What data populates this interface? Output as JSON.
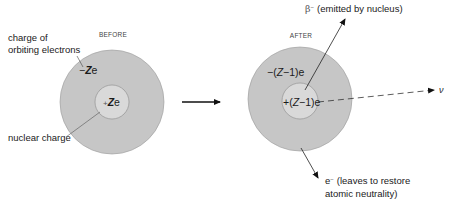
{
  "before": {
    "title": "BEFORE",
    "electron_charge_label_line1": "charge of",
    "electron_charge_label_line2": "orbiting electrons",
    "electron_charge_sign": "−",
    "electron_charge_Z": "Z",
    "electron_charge_e": "e",
    "nuclear_charge_sign": "+",
    "nuclear_charge_Z": "Z",
    "nuclear_charge_e": "e",
    "nuclear_charge_label": "nuclear charge"
  },
  "after": {
    "title": "AFTER",
    "beta_symbol": "β",
    "beta_sup": "−",
    "beta_label": "(emitted by nucleus)",
    "electron_shell_prefix": "−(",
    "electron_shell_Z": "Z",
    "electron_shell_suffix": "−1)e",
    "nucleus_prefix": "+(",
    "nucleus_Z": "Z",
    "nucleus_suffix": "−1)e",
    "neutrino_symbol": "ν",
    "electron_symbol": "e",
    "electron_sup": "−",
    "electron_label_line1": "(leaves to restore",
    "electron_label_line2": "atomic neutrality)"
  },
  "colors": {
    "outer_shell": "#c6c6c6",
    "outer_stroke": "#9a9a9a",
    "nucleus": "#d9d9d9",
    "nucleus_stroke": "#8a8a8a",
    "line": "#222222"
  }
}
